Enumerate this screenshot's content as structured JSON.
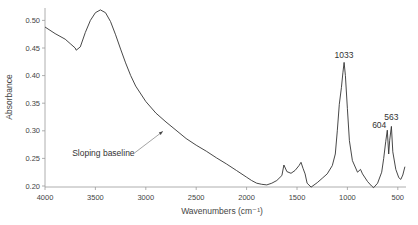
{
  "chart_data": {
    "type": "line",
    "title": "",
    "xlabel": "Wavenumbers (cm⁻¹)",
    "ylabel": "Absorbance",
    "xlim": [
      4000,
      430
    ],
    "ylim": [
      0.195,
      0.52
    ],
    "x_reversed": true,
    "grid": false,
    "legend": null,
    "xticks": [
      4000,
      3500,
      3000,
      2500,
      2000,
      1500,
      1000,
      500
    ],
    "xtick_labels": [
      "4000",
      "3500",
      "3000",
      "2500",
      "2000",
      "1500",
      "1000",
      "500"
    ],
    "yticks": [
      0.2,
      0.25,
      0.3,
      0.35,
      0.4,
      0.45,
      0.5
    ],
    "ytick_labels": [
      "0.20",
      "0.25",
      "0.30",
      "0.35",
      "0.40",
      "0.45",
      "0.50"
    ],
    "series": [
      {
        "name": "IR spectrum",
        "color": "#333333",
        "x": [
          4000,
          3900,
          3800,
          3750,
          3700,
          3690,
          3650,
          3600,
          3550,
          3500,
          3450,
          3400,
          3350,
          3300,
          3250,
          3200,
          3150,
          3100,
          3000,
          2900,
          2800,
          2700,
          2600,
          2500,
          2400,
          2300,
          2200,
          2100,
          2000,
          1950,
          1900,
          1850,
          1800,
          1750,
          1700,
          1650,
          1630,
          1600,
          1560,
          1520,
          1480,
          1460,
          1440,
          1420,
          1400,
          1360,
          1300,
          1250,
          1200,
          1150,
          1120,
          1100,
          1080,
          1060,
          1045,
          1033,
          1020,
          1000,
          980,
          950,
          900,
          870,
          850,
          800,
          760,
          740,
          700,
          660,
          640,
          620,
          604,
          590,
          580,
          563,
          550,
          520,
          490,
          470,
          450,
          430
        ],
        "y": [
          0.488,
          0.476,
          0.466,
          0.458,
          0.45,
          0.446,
          0.452,
          0.478,
          0.5,
          0.514,
          0.519,
          0.514,
          0.498,
          0.474,
          0.448,
          0.423,
          0.4,
          0.381,
          0.353,
          0.332,
          0.316,
          0.301,
          0.286,
          0.274,
          0.263,
          0.251,
          0.24,
          0.228,
          0.216,
          0.21,
          0.205,
          0.203,
          0.202,
          0.205,
          0.21,
          0.219,
          0.238,
          0.226,
          0.223,
          0.228,
          0.237,
          0.243,
          0.232,
          0.222,
          0.205,
          0.198,
          0.206,
          0.214,
          0.222,
          0.237,
          0.258,
          0.3,
          0.348,
          0.378,
          0.405,
          0.424,
          0.4,
          0.34,
          0.282,
          0.246,
          0.225,
          0.23,
          0.222,
          0.208,
          0.2,
          0.197,
          0.205,
          0.225,
          0.25,
          0.28,
          0.301,
          0.258,
          0.283,
          0.308,
          0.262,
          0.23,
          0.215,
          0.212,
          0.22,
          0.235
        ]
      }
    ],
    "annotations": [
      {
        "text": "Sloping baseline",
        "x_text": 3730,
        "y_text": 0.254,
        "arrow_to": [
          2830,
          0.299
        ]
      },
      {
        "text": "1033",
        "x": 1033,
        "y": 0.424
      },
      {
        "text": "604",
        "x": 604,
        "y": 0.301
      },
      {
        "text": "563",
        "x": 563,
        "y": 0.308
      }
    ]
  }
}
